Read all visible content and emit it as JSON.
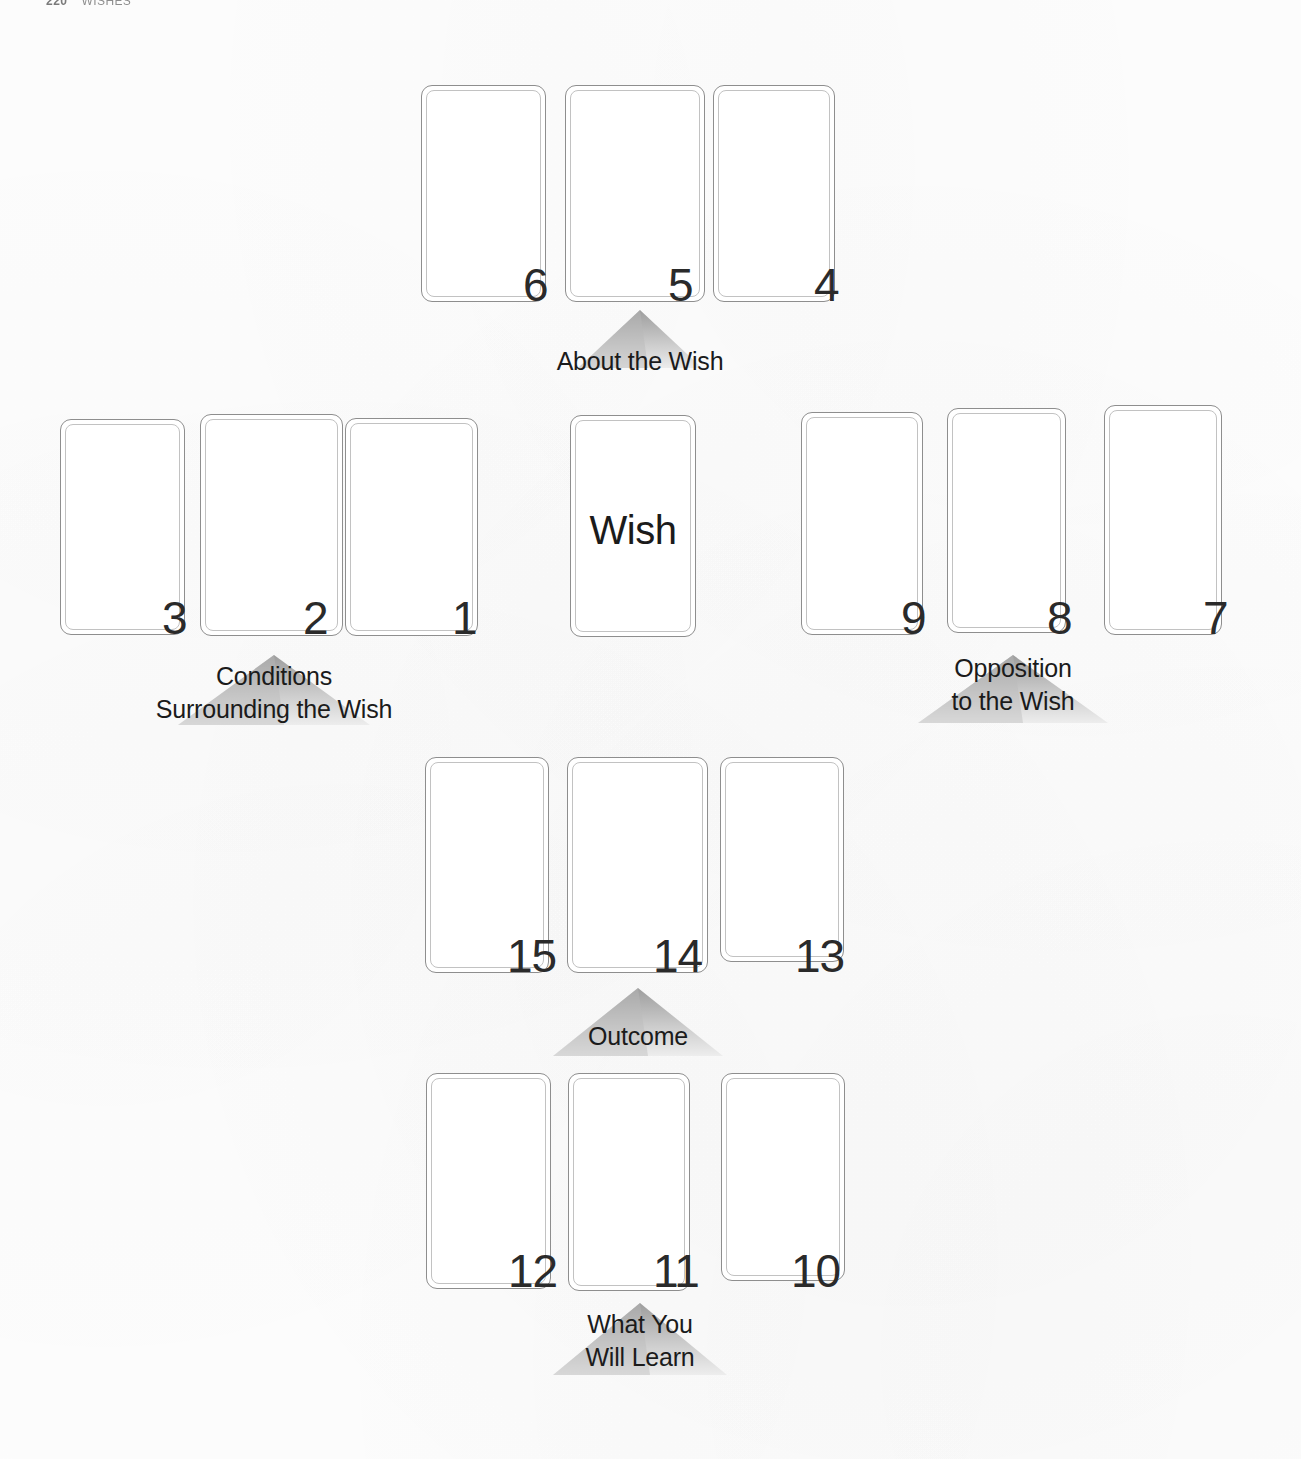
{
  "page": {
    "folio": "220",
    "running_head": "WISHES"
  },
  "spread": {
    "center_card": {
      "label": "Wish",
      "name": "wish-card"
    },
    "groups": [
      {
        "id": "about-the-wish",
        "label_lines": [
          "About the Wish"
        ],
        "cards": [
          "6",
          "5",
          "4"
        ]
      },
      {
        "id": "conditions-surrounding-the-wish",
        "label_lines": [
          "Conditions",
          "Surrounding the Wish"
        ],
        "cards": [
          "3",
          "2",
          "1"
        ]
      },
      {
        "id": "opposition-to-the-wish",
        "label_lines": [
          "Opposition",
          "to the Wish"
        ],
        "cards": [
          "9",
          "8",
          "7"
        ]
      },
      {
        "id": "outcome",
        "label_lines": [
          "Outcome"
        ],
        "cards": [
          "15",
          "14",
          "13"
        ]
      },
      {
        "id": "what-you-will-learn",
        "label_lines": [
          "What You",
          "Will Learn"
        ],
        "cards": [
          "12",
          "11",
          "10"
        ]
      }
    ],
    "positions": [
      {
        "n": "1",
        "group": "conditions-surrounding-the-wish"
      },
      {
        "n": "2",
        "group": "conditions-surrounding-the-wish"
      },
      {
        "n": "3",
        "group": "conditions-surrounding-the-wish"
      },
      {
        "n": "4",
        "group": "about-the-wish"
      },
      {
        "n": "5",
        "group": "about-the-wish"
      },
      {
        "n": "6",
        "group": "about-the-wish"
      },
      {
        "n": "7",
        "group": "opposition-to-the-wish"
      },
      {
        "n": "8",
        "group": "opposition-to-the-wish"
      },
      {
        "n": "9",
        "group": "opposition-to-the-wish"
      },
      {
        "n": "10",
        "group": "what-you-will-learn"
      },
      {
        "n": "11",
        "group": "what-you-will-learn"
      },
      {
        "n": "12",
        "group": "what-you-will-learn"
      },
      {
        "n": "13",
        "group": "outcome"
      },
      {
        "n": "14",
        "group": "outcome"
      },
      {
        "n": "15",
        "group": "outcome"
      }
    ]
  },
  "colors": {
    "card_border": "#8e8e8e",
    "card_inner_border": "#c2c2c2",
    "card_fill": "#ffffff",
    "number_text": "#2a2a2a",
    "label_text": "#1b1b1b",
    "pyramid_light": "#e9e9e9",
    "pyramid_dark": "#a8a8a8",
    "background": "#ffffff"
  }
}
